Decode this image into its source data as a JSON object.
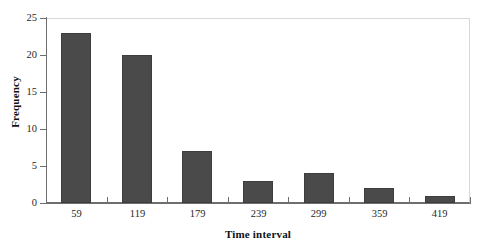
{
  "chart_data": {
    "type": "bar",
    "title": "",
    "subtitle": "",
    "xlabel": "Time interval",
    "ylabel": "Frequency",
    "categories": [
      "59",
      "119",
      "179",
      "239",
      "299",
      "359",
      "419"
    ],
    "values": [
      23,
      20,
      7,
      3,
      4,
      2,
      1
    ],
    "series": [
      {
        "name": "Frequency",
        "values": [
          23,
          20,
          7,
          3,
          4,
          2,
          1
        ]
      }
    ],
    "ylim": [
      0,
      25
    ],
    "ytick_values": [
      0,
      5,
      10,
      15,
      20,
      25
    ],
    "ytick_labels": [
      "0",
      "5",
      "10",
      "15",
      "20",
      "25"
    ],
    "xtick_labels": [
      "59",
      "119",
      "179",
      "239",
      "299",
      "359",
      "419"
    ],
    "grid": false,
    "legend": false,
    "legend_position": "none",
    "annotations": [],
    "colors": {
      "background": "#ffffff",
      "bar_fill": "#4a4a4a",
      "bar_edge": "#3d3d3d",
      "axis_line": "#6e6e6e",
      "frame_line": "#d8d8d8",
      "text": "#1f1f1f"
    }
  }
}
